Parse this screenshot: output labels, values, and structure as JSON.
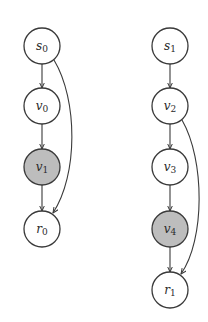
{
  "diagram": {
    "colors": {
      "stroke": "#3a3a3a",
      "node_fill": "#ffffff",
      "highlight_fill": "#bdbdbd",
      "background": "#ffffff"
    },
    "graphs": [
      {
        "nodes": [
          {
            "id": "s0",
            "base": "s",
            "sub": "0",
            "cx": 42,
            "cy": 46,
            "highlighted": false
          },
          {
            "id": "v0",
            "base": "v",
            "sub": "0",
            "cx": 42,
            "cy": 106,
            "highlighted": false
          },
          {
            "id": "v1",
            "base": "v",
            "sub": "1",
            "cx": 42,
            "cy": 167,
            "highlighted": true
          },
          {
            "id": "r0",
            "base": "r",
            "sub": "0",
            "cx": 42,
            "cy": 229,
            "highlighted": false
          }
        ],
        "edges": [
          {
            "from": "s0",
            "to": "v0",
            "type": "straight"
          },
          {
            "from": "v0",
            "to": "v1",
            "type": "straight"
          },
          {
            "from": "v1",
            "to": "r0",
            "type": "straight"
          },
          {
            "from": "s0",
            "to": "r0",
            "type": "curved"
          }
        ]
      },
      {
        "nodes": [
          {
            "id": "s1",
            "base": "s",
            "sub": "1",
            "cx": 170,
            "cy": 46,
            "highlighted": false
          },
          {
            "id": "v2",
            "base": "v",
            "sub": "2",
            "cx": 170,
            "cy": 106,
            "highlighted": false
          },
          {
            "id": "v3",
            "base": "v",
            "sub": "3",
            "cx": 170,
            "cy": 167,
            "highlighted": false
          },
          {
            "id": "v4",
            "base": "v",
            "sub": "4",
            "cx": 170,
            "cy": 229,
            "highlighted": true
          },
          {
            "id": "r1",
            "base": "r",
            "sub": "1",
            "cx": 170,
            "cy": 290,
            "highlighted": false
          }
        ],
        "edges": [
          {
            "from": "s1",
            "to": "v2",
            "type": "straight"
          },
          {
            "from": "v2",
            "to": "v3",
            "type": "straight"
          },
          {
            "from": "v3",
            "to": "v4",
            "type": "straight"
          },
          {
            "from": "v4",
            "to": "r1",
            "type": "straight"
          },
          {
            "from": "v2",
            "to": "r1",
            "type": "curved"
          }
        ]
      }
    ]
  }
}
